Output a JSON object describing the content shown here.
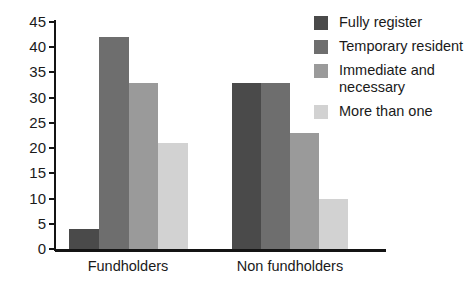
{
  "chart_data": {
    "type": "bar",
    "title": "",
    "xlabel": "",
    "ylabel": "",
    "categories": [
      "Fundholders",
      "Non fundholders"
    ],
    "series": [
      {
        "name": "Fully register",
        "values": [
          4,
          33
        ],
        "color": "#4a4a4a"
      },
      {
        "name": "Temporary resident",
        "values": [
          42,
          33
        ],
        "color": "#6e6e6e"
      },
      {
        "name": "Immediate and necessary",
        "values": [
          33,
          23
        ],
        "color": "#9a9a9a"
      },
      {
        "name": "More than one",
        "values": [
          21,
          10
        ],
        "color": "#d2d2d2"
      }
    ],
    "ylim": [
      0,
      45
    ],
    "yticks": [
      0,
      5,
      10,
      15,
      20,
      25,
      30,
      35,
      40,
      45
    ],
    "ytick_labels": [
      "0",
      "5",
      "10",
      "15",
      "20",
      "25",
      "30",
      "35",
      "40",
      "45"
    ],
    "grid": false,
    "legend_position": "top-right"
  },
  "legend": {
    "entries": [
      {
        "label": "Fully register",
        "color": "#4a4a4a"
      },
      {
        "label": "Temporary resident",
        "color": "#6e6e6e"
      },
      {
        "label": "Immediate and necessary",
        "color": "#9a9a9a"
      },
      {
        "label": "More than one",
        "color": "#d2d2d2"
      }
    ]
  }
}
